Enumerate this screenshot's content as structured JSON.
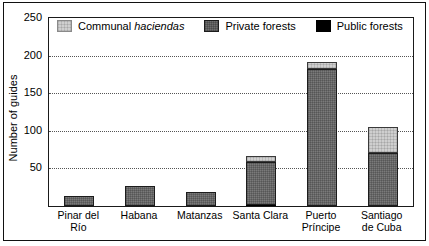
{
  "chart_data": {
    "type": "bar",
    "stacked": true,
    "title": "",
    "xlabel": "",
    "ylabel": "Number of guides",
    "ylim": [
      0,
      250
    ],
    "ytick_step": 50,
    "yticks": [
      0,
      50,
      100,
      150,
      200,
      250
    ],
    "ytick_labels": [
      "",
      "50",
      "100",
      "150",
      "200",
      "250"
    ],
    "grid": "horizontal-dotted",
    "legend_position": "top-inside",
    "categories": [
      "Pinar del Río",
      "Habana",
      "Matanzas",
      "Santa Clara",
      "Puerto Príncipe",
      "Santiago de Cuba"
    ],
    "category_lines": [
      [
        "Pinar del Río"
      ],
      [
        "Habana"
      ],
      [
        "Matanzas"
      ],
      [
        "Santa Clara"
      ],
      [
        "Puerto",
        "Príncipe"
      ],
      [
        "Santiago",
        "de Cuba"
      ]
    ],
    "series": [
      {
        "name": "Public forests",
        "color": "#000000",
        "values": [
          0,
          0,
          0,
          2,
          0,
          0
        ]
      },
      {
        "name": "Private forests",
        "color": "#7a7a7a",
        "values": [
          13,
          27,
          19,
          57,
          182,
          70
        ]
      },
      {
        "name": "Communal haciendas",
        "color": "#cfcfcf",
        "values": [
          0,
          0,
          0,
          8,
          10,
          35
        ]
      }
    ],
    "totals": [
      13,
      27,
      19,
      67,
      192,
      105
    ]
  },
  "legend": {
    "entries": [
      {
        "label_prefix": "Communal ",
        "label_italic": "haciendas",
        "swatch": "communal-swatch"
      },
      {
        "label_prefix": "Private forests",
        "label_italic": "",
        "swatch": "private-swatch"
      },
      {
        "label_prefix": "Public forests",
        "label_italic": "",
        "swatch": "public-swatch"
      }
    ]
  },
  "axis": {
    "y_title": "Number of guides"
  }
}
